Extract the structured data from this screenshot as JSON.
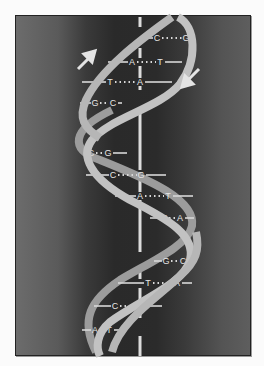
{
  "diagram": {
    "colors": {
      "page_background": "#fbfbfb",
      "panel_dark": "#2a2a2a",
      "panel_light": "#6c6c6c",
      "strand": "#bdbdbd",
      "strand_back": "#9a9a9a",
      "rung": "#d8d8d8",
      "axis": "#dcdcdc",
      "label": "#e6e6e6"
    },
    "arrows": [
      {
        "name": "strand-direction-up-arrow",
        "direction": "up-right"
      },
      {
        "name": "strand-direction-down-arrow",
        "direction": "down-left"
      }
    ],
    "base_pairs": [
      {
        "left": "C",
        "right": "G",
        "y": 38,
        "x1": 146,
        "x2": 194,
        "lx": 157,
        "rx": 186
      },
      {
        "left": "A",
        "right": "T",
        "y": 62,
        "x1": 108,
        "x2": 182,
        "lx": 132,
        "rx": 160
      },
      {
        "left": "T",
        "right": "A",
        "y": 82,
        "x1": 82,
        "x2": 172,
        "lx": 110,
        "rx": 140
      },
      {
        "left": "G",
        "right": "C",
        "y": 103,
        "x1": 80,
        "x2": 122,
        "lx": 95,
        "rx": 113
      },
      {
        "left": "C",
        "right": "G",
        "y": 153,
        "x1": 84,
        "x2": 127,
        "lx": 91,
        "rx": 108
      },
      {
        "left": "C",
        "right": "G",
        "y": 175,
        "x1": 86,
        "x2": 166,
        "lx": 113,
        "rx": 141
      },
      {
        "left": "A",
        "right": "T",
        "y": 196,
        "x1": 115,
        "x2": 193,
        "lx": 140,
        "rx": 168
      },
      {
        "left": "T",
        "right": "A",
        "y": 218,
        "x1": 150,
        "x2": 194,
        "lx": 164,
        "rx": 180
      },
      {
        "left": "G",
        "right": "C",
        "y": 261,
        "x1": 154,
        "x2": 194,
        "lx": 166,
        "rx": 183
      },
      {
        "left": "T",
        "right": "A",
        "y": 283,
        "x1": 118,
        "x2": 192,
        "lx": 148,
        "rx": 177
      },
      {
        "left": "C",
        "right": "G",
        "y": 306,
        "x1": 94,
        "x2": 162,
        "lx": 115,
        "rx": 143
      },
      {
        "left": "A",
        "right": "T",
        "y": 330,
        "x1": 82,
        "x2": 126,
        "lx": 95,
        "rx": 109
      }
    ]
  }
}
